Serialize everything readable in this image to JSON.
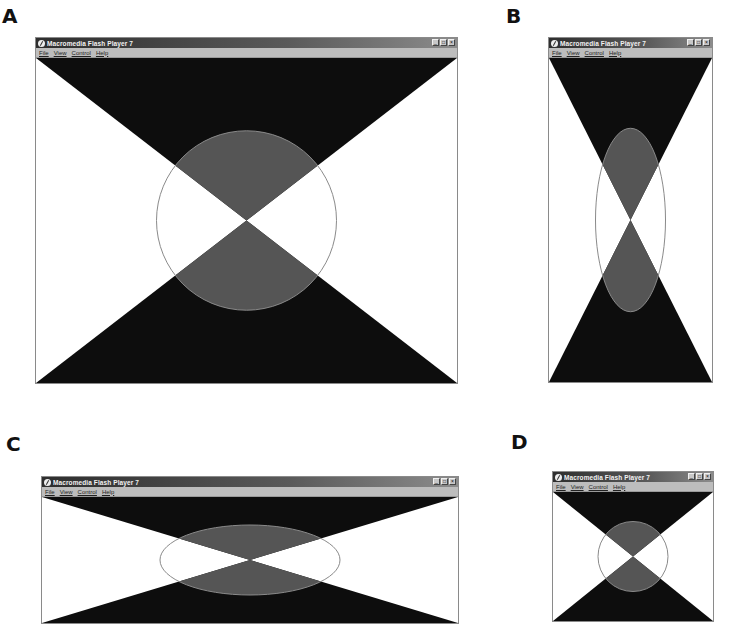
{
  "figure": {
    "panels": [
      {
        "label": "A",
        "window": {
          "title": "Macromedia Flash Player 7",
          "menu": [
            "File",
            "View",
            "Control",
            "Help"
          ],
          "buttons": [
            "_",
            "□",
            "×"
          ]
        },
        "stage": {
          "width": 420,
          "height": 326,
          "shape": "circle",
          "rx": 90,
          "ry": 90
        }
      },
      {
        "label": "B",
        "window": {
          "title": "Macromedia Flash Player 7",
          "menu": [
            "File",
            "View",
            "Control",
            "Help"
          ],
          "buttons": [
            "_",
            "□",
            "×"
          ]
        },
        "stage": {
          "width": 162,
          "height": 326,
          "shape": "ellipse",
          "rx": 35,
          "ry": 92
        }
      },
      {
        "label": "C",
        "window": {
          "title": "Macromedia Flash Player 7",
          "menu": [
            "File",
            "View",
            "Control",
            "Help"
          ],
          "buttons": [
            "_",
            "□",
            "×"
          ]
        },
        "stage": {
          "width": 415,
          "height": 125,
          "shape": "ellipse",
          "rx": 90,
          "ry": 35
        }
      },
      {
        "label": "D",
        "window": {
          "title": "Macromedia Flash Player 7",
          "menu": [
            "File",
            "View",
            "Control",
            "Help"
          ],
          "buttons": [
            "_",
            "□",
            "×"
          ]
        },
        "stage": {
          "width": 159,
          "height": 127,
          "shape": "circle",
          "rx": 35,
          "ry": 35
        }
      }
    ],
    "colors": {
      "triangle_fill": "#0d0d0d",
      "overlap_fill": "#555555",
      "ellipse_stroke": "#8a8a8a",
      "background": "#ffffff"
    }
  }
}
